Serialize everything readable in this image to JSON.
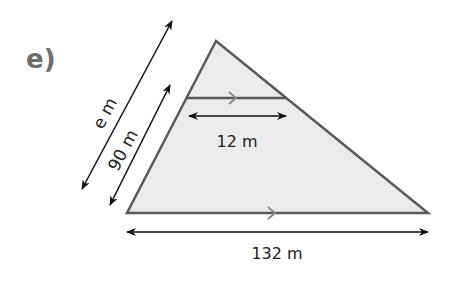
{
  "part_label": "e)",
  "colors": {
    "triangle_fill": "#ebebeb",
    "triangle_stroke": "#5a5a5a",
    "arrow": "#111111",
    "part_label": "#6e6e6e",
    "parallel_mark": "#888888"
  },
  "diagram": {
    "shape": "triangle with line parallel to base",
    "labels": {
      "full_side": "e m",
      "partial_side": "90 m",
      "top_parallel": "12 m",
      "base": "132 m"
    }
  }
}
